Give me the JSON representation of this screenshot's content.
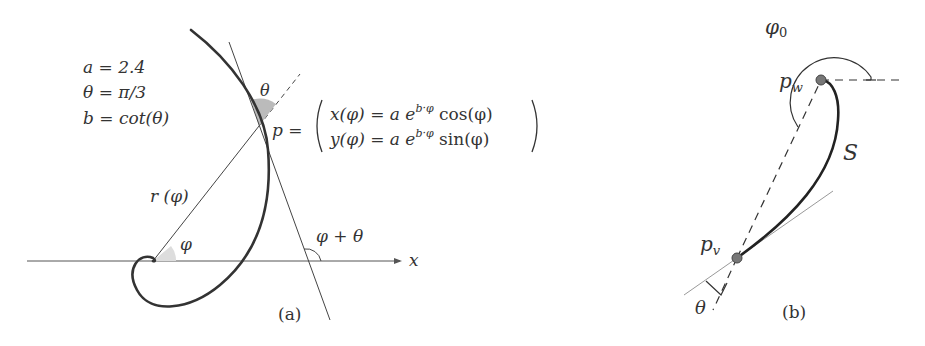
{
  "panel_a": {
    "caption": "(a)",
    "params": [
      "a = 2.4",
      "θ = π/3",
      "b = cot(θ)"
    ],
    "label_theta": "θ",
    "label_p": "p =",
    "eq_x": "x(φ) = a e",
    "eq_x_sup": "b·φ",
    "eq_x_tail": " cos(φ)",
    "eq_y": "y(φ) = a e",
    "eq_y_sup": "b·φ",
    "eq_y_tail": " sin(φ)",
    "label_r": "r (φ)",
    "label_phi": "φ",
    "label_phi_theta": "φ + θ",
    "label_x": "x"
  },
  "panel_b": {
    "caption": "(b)",
    "label_phi0": "φ",
    "label_phi0_sub": "0",
    "label_pw": "p",
    "label_pw_sub": "w",
    "label_pv": "p",
    "label_pv_sub": "v",
    "label_S": "S",
    "label_theta": "θ"
  }
}
